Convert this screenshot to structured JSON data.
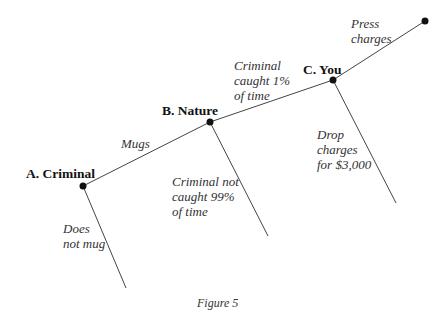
{
  "diagram": {
    "type": "game-tree",
    "nodes": {
      "a": {
        "label": "A. Criminal"
      },
      "b": {
        "label": "B. Nature"
      },
      "c": {
        "label": "C. You"
      }
    },
    "branches": {
      "mugs": "Mugs",
      "does_not_mug": "Does\nnot mug",
      "caught": "Criminal\ncaught 1%\nof time",
      "not_caught": "Criminal not\ncaught 99%\nof time",
      "press": "Press\ncharges",
      "drop": "Drop\ncharges\nfor $3,000"
    },
    "caption": "Figure 5"
  }
}
